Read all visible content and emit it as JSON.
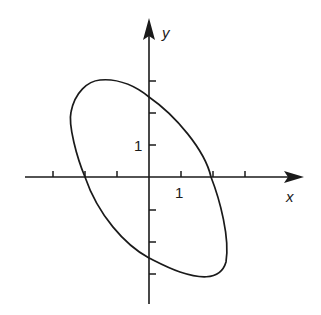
{
  "diagram": {
    "type": "ellipse on cartesian axes",
    "x_axis_label": "x",
    "y_axis_label": "y",
    "x_tick_label": "1",
    "y_tick_label": "1",
    "x_ticks": [
      -3,
      -2,
      -1,
      1,
      2,
      3
    ],
    "y_ticks": [
      3,
      2,
      1,
      -1,
      -2,
      -3
    ],
    "ellipse": {
      "center": [
        0,
        0
      ],
      "x_intercepts": [
        -2,
        2
      ],
      "y_intercepts": [
        2.5,
        -2.5
      ],
      "orientation": "major axis from upper-left to lower-right"
    },
    "stroke_color": "#1a1a1a",
    "background": "#ffffff"
  }
}
